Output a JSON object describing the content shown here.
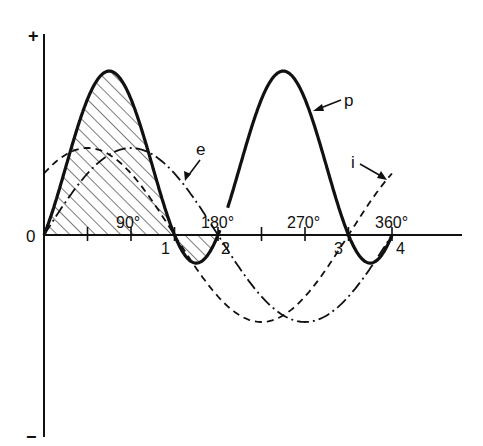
{
  "diagram": {
    "type": "waveform",
    "axis": {
      "plus_sign": "+",
      "minus_sign": "−",
      "origin_label": "0",
      "degree_labels": [
        "90°",
        "180°",
        "270°",
        "360°"
      ],
      "point_labels": [
        "1",
        "2",
        "3",
        "4"
      ]
    },
    "curves": {
      "p": {
        "label": "p",
        "style": "solid-heavy",
        "description": "power"
      },
      "e": {
        "label": "e",
        "style": "dash-dot",
        "description": "voltage"
      },
      "i": {
        "label": "i",
        "style": "dashed",
        "description": "current"
      }
    },
    "shading": "hatched area under positive and negative p lobes between 0 and 2"
  },
  "chart_data": {
    "type": "line",
    "title": "",
    "xlabel": "",
    "ylabel": "",
    "x_ticks_deg": [
      0,
      45,
      90,
      135,
      180,
      225,
      270,
      315,
      360
    ],
    "x_tick_labels": {
      "90": "90°",
      "180": "180°",
      "270": "270°",
      "360": "360°"
    },
    "series": [
      {
        "name": "e",
        "formula": "sin(θ)",
        "style": "dash-dot",
        "phase_deg": 0
      },
      {
        "name": "i",
        "formula": "sin(θ+45°)",
        "style": "dashed",
        "phase_deg": 45
      },
      {
        "name": "p",
        "formula": "e·i",
        "style": "solid",
        "zeros_deg": [
          0,
          135,
          180,
          315,
          360
        ],
        "zero_labels": [
          "0",
          "1",
          "2",
          "3",
          "4"
        ]
      }
    ]
  }
}
